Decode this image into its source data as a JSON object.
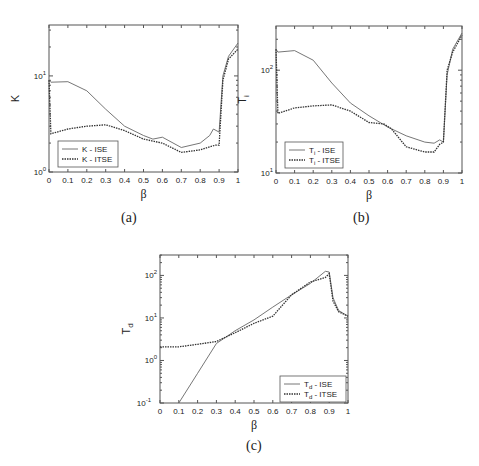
{
  "figure": {
    "captions": {
      "a": "(a)",
      "b": "(b)",
      "c": "(c)"
    }
  },
  "chart_data": [
    {
      "id": "a",
      "type": "line",
      "title": "",
      "xlabel": "β",
      "ylabel": "K",
      "yscale": "log",
      "xlim": [
        0,
        1
      ],
      "ylim_exp": [
        0,
        1.53
      ],
      "xticks": [
        "0",
        "0.1",
        "0.2",
        "0.3",
        "0.4",
        "0.5",
        "0.6",
        "0.7",
        "0.8",
        "0.9",
        "1"
      ],
      "yticks": [
        {
          "exp": 0,
          "label": "10",
          "sup": "0"
        },
        {
          "exp": 1,
          "label": "10",
          "sup": "1"
        }
      ],
      "legend": {
        "position": "lower left"
      },
      "series": [
        {
          "name": "K - ISE",
          "style": "solid",
          "x": [
            0,
            0.01,
            0.1,
            0.2,
            0.3,
            0.4,
            0.5,
            0.55,
            0.6,
            0.7,
            0.8,
            0.85,
            0.87,
            0.9,
            0.92,
            0.95,
            1
          ],
          "y": [
            9,
            8.6,
            8.7,
            7,
            4.5,
            3,
            2.4,
            2.2,
            2.3,
            1.8,
            2,
            2.4,
            2.8,
            2.6,
            10,
            16,
            22
          ]
        },
        {
          "name": "K - ITSE",
          "style": "dotted",
          "x": [
            0,
            0.01,
            0.1,
            0.2,
            0.3,
            0.4,
            0.5,
            0.6,
            0.7,
            0.8,
            0.88,
            0.9,
            0.92,
            0.95,
            1
          ],
          "y": [
            9,
            2.5,
            2.8,
            3,
            3.1,
            2.7,
            2.2,
            2,
            1.6,
            1.7,
            1.9,
            1.9,
            9,
            15,
            19
          ]
        }
      ]
    },
    {
      "id": "b",
      "type": "line",
      "title": "",
      "xlabel": "β",
      "ylabel": "T_i",
      "yscale": "log",
      "xlim": [
        0,
        1
      ],
      "ylim_exp": [
        1,
        2.43
      ],
      "xticks": [
        "0",
        "0.1",
        "0.2",
        "0.3",
        "0.4",
        "0.5",
        "0.6",
        "0.7",
        "0.8",
        "0.9",
        "1"
      ],
      "yticks": [
        {
          "exp": 1,
          "label": "10",
          "sup": "1"
        },
        {
          "exp": 2,
          "label": "10",
          "sup": "2"
        }
      ],
      "legend": {
        "position": "lower left"
      },
      "series": [
        {
          "name": "T_i - ISE",
          "style": "solid",
          "x": [
            0,
            0.01,
            0.1,
            0.2,
            0.3,
            0.4,
            0.5,
            0.6,
            0.7,
            0.8,
            0.85,
            0.88,
            0.9,
            0.92,
            0.95,
            1
          ],
          "y": [
            160,
            150,
            155,
            125,
            75,
            48,
            36,
            28,
            23,
            20,
            19.5,
            21,
            20,
            90,
            160,
            230
          ]
        },
        {
          "name": "T_i - ITSE",
          "style": "dotted",
          "x": [
            0,
            0.01,
            0.1,
            0.2,
            0.3,
            0.4,
            0.5,
            0.58,
            0.62,
            0.7,
            0.8,
            0.85,
            0.88,
            0.9,
            0.92,
            0.95,
            1
          ],
          "y": [
            160,
            38,
            43,
            45,
            46,
            40,
            31,
            30,
            27,
            18,
            16,
            16,
            19,
            20,
            100,
            150,
            220
          ]
        }
      ]
    },
    {
      "id": "c",
      "type": "line",
      "title": "",
      "xlabel": "β",
      "ylabel": "T_d",
      "yscale": "log",
      "xlim": [
        0,
        1
      ],
      "ylim_exp": [
        -1,
        2.48
      ],
      "xticks": [
        "0",
        "0.1",
        "0.2",
        "0.3",
        "0.4",
        "0.5",
        "0.6",
        "0.7",
        "0.8",
        "0.9",
        "1"
      ],
      "yticks": [
        {
          "exp": -1,
          "label": "10",
          "sup": "-1"
        },
        {
          "exp": 0,
          "label": "10",
          "sup": "0"
        },
        {
          "exp": 1,
          "label": "10",
          "sup": "1"
        },
        {
          "exp": 2,
          "label": "10",
          "sup": "2"
        }
      ],
      "legend": {
        "position": "lower right"
      },
      "series": [
        {
          "name": "T_d - ISE",
          "style": "solid",
          "x": [
            0.1,
            0.2,
            0.3,
            0.4,
            0.5,
            0.6,
            0.7,
            0.8,
            0.88,
            0.9,
            0.92,
            0.95,
            1
          ],
          "y": [
            0.1,
            0.5,
            2.5,
            5,
            9,
            18,
            35,
            65,
            125,
            120,
            30,
            15,
            11
          ]
        },
        {
          "name": "T_d - ITSE",
          "style": "dotted",
          "x": [
            0,
            0.1,
            0.2,
            0.3,
            0.4,
            0.5,
            0.6,
            0.7,
            0.8,
            0.88,
            0.9,
            0.92,
            0.95,
            1
          ],
          "y": [
            2.1,
            2.1,
            2.4,
            2.8,
            4.5,
            7.5,
            11,
            35,
            70,
            90,
            110,
            25,
            14,
            11
          ]
        }
      ]
    }
  ]
}
